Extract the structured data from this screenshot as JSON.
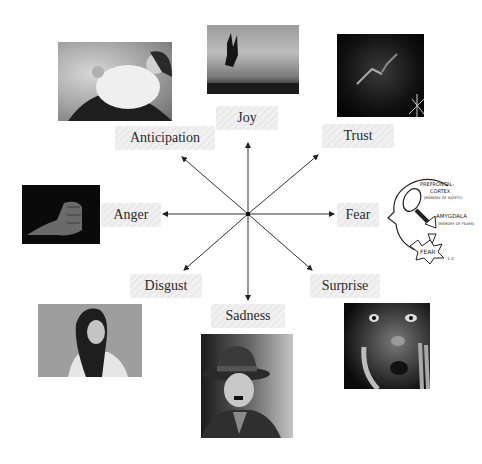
{
  "diagram": {
    "type": "emotion-wheel",
    "center": {
      "x": 248,
      "y": 214
    },
    "emotions": [
      {
        "id": "joy",
        "label": "Joy",
        "image": "person-jumping-silhouette"
      },
      {
        "id": "trust",
        "label": "Trust",
        "image": "hands-reaching-dark"
      },
      {
        "id": "fear",
        "label": "Fear",
        "image": "brain-sketch-head"
      },
      {
        "id": "surprise",
        "label": "Surprise",
        "image": "shocked-face"
      },
      {
        "id": "sadness",
        "label": "Sadness",
        "image": "sad-man-bowler-hat"
      },
      {
        "id": "disgust",
        "label": "Disgust",
        "image": "disgusted-woman"
      },
      {
        "id": "anger",
        "label": "Anger",
        "image": "clenched-fist"
      },
      {
        "id": "anticipation",
        "label": "Anticipation",
        "image": "pregnant-woman"
      }
    ],
    "sketch_text": {
      "line1": "PREFRONTAL-",
      "line2": "CORTEX",
      "line3": "(MEMORY OF SAFETY)",
      "line4": "AMYGDALA",
      "line5": "(MEMORY OF FEARS)",
      "fear": "FEAR",
      "sig": "L.C"
    },
    "colors": {
      "arrow": "#222222",
      "label_bg": "#eeeeee",
      "text": "#2a2a2a"
    }
  }
}
